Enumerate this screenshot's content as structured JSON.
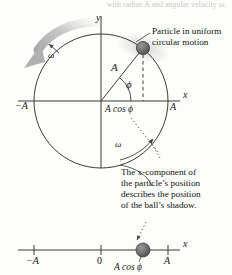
{
  "figure": {
    "clipped_top_text": "with radius A and angular velocity ω.",
    "background_color": "#fdfdfb",
    "line_color": "#3a3a3a",
    "ball_color": "#6b6b6b",
    "arrow_gray": "#b3b3b3"
  },
  "upper_diagram": {
    "y_axis_label": "y",
    "x_axis_label": "x",
    "radius_label": "A",
    "angle_label": "ϕ",
    "left_amplitude_label": "−A",
    "right_amplitude_label": "A",
    "projection_label": "A cos ϕ",
    "omega_label_left": "ω",
    "omega_label_right": "ω"
  },
  "annotations": {
    "particle_callout_line1": "Particle in uniform",
    "particle_callout_line2": "circular motion",
    "shadow_callout_line1": "The x-component of",
    "shadow_callout_line2": "the particle’s position",
    "shadow_callout_line3": "describes the position",
    "shadow_callout_line4": "of the ball’s shadow."
  },
  "lower_axis": {
    "axis_label": "x",
    "tick_minus_a": "−A",
    "tick_zero": "0",
    "tick_a": "A",
    "ball_label": "A cos ϕ"
  }
}
